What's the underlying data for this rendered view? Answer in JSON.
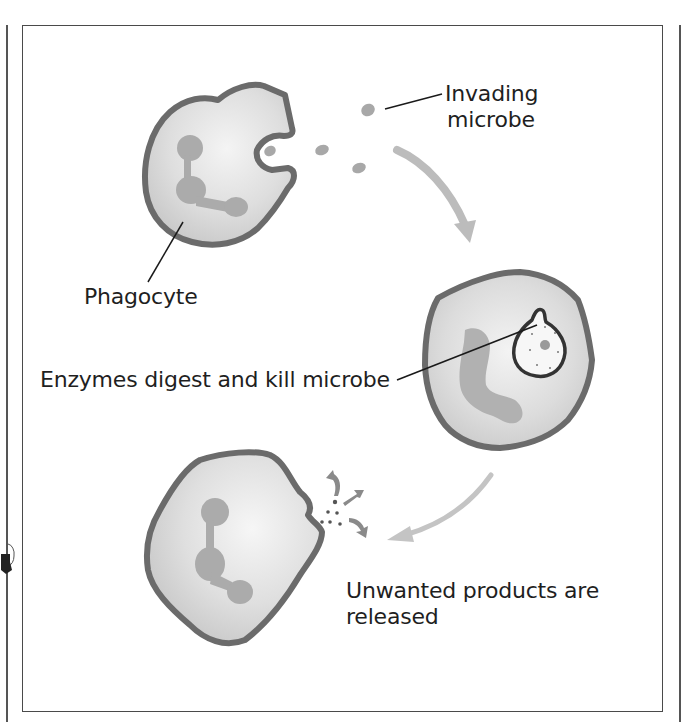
{
  "diagram": {
    "labels": {
      "invading_microbe_line1": "Invading",
      "invading_microbe_line2": "microbe",
      "phagocyte": "Phagocyte",
      "enzymes": "Enzymes digest and kill microbe",
      "unwanted_line1": "Unwanted products are",
      "unwanted_line2": "released"
    },
    "stages": [
      {
        "step": 1,
        "description": "Phagocyte engulfs invading microbe"
      },
      {
        "step": 2,
        "description": "Enzymes digest and kill microbe"
      },
      {
        "step": 3,
        "description": "Unwanted products are released"
      }
    ],
    "colors": {
      "cell_border": "#6b6b6b",
      "cell_fill": "#d9d9d9",
      "cell_center": "#f2f2f2",
      "nucleus": "#a9a9a9",
      "microbe": "#a6a6a6",
      "arrow": "#bdbdbd",
      "line": "#1a1a1a",
      "frame": "#4a4a4a"
    }
  }
}
